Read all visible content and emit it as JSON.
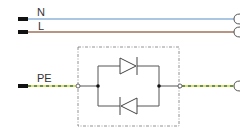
{
  "diagram": {
    "type": "electrical-schematic",
    "conductors": [
      {
        "id": "N",
        "label": "N",
        "color": "#8fb3d9",
        "style": "solid",
        "y": 19
      },
      {
        "id": "L",
        "label": "L",
        "color": "#a0705a",
        "style": "solid",
        "y": 32
      },
      {
        "id": "PE",
        "label": "PE",
        "color": "#c9d94a",
        "color_alt": "#4a7a2a",
        "style": "dashed-green-yellow",
        "y": 86
      }
    ],
    "components": [
      {
        "type": "diode",
        "orientation": "forward-right",
        "branch": "top"
      },
      {
        "type": "diode",
        "orientation": "forward-left",
        "branch": "bottom"
      }
    ],
    "enclosure": {
      "style": "dash-dot",
      "color": "#777777"
    },
    "colors": {
      "wire": "#555555",
      "terminal": "#111111",
      "component": "#444444"
    }
  }
}
